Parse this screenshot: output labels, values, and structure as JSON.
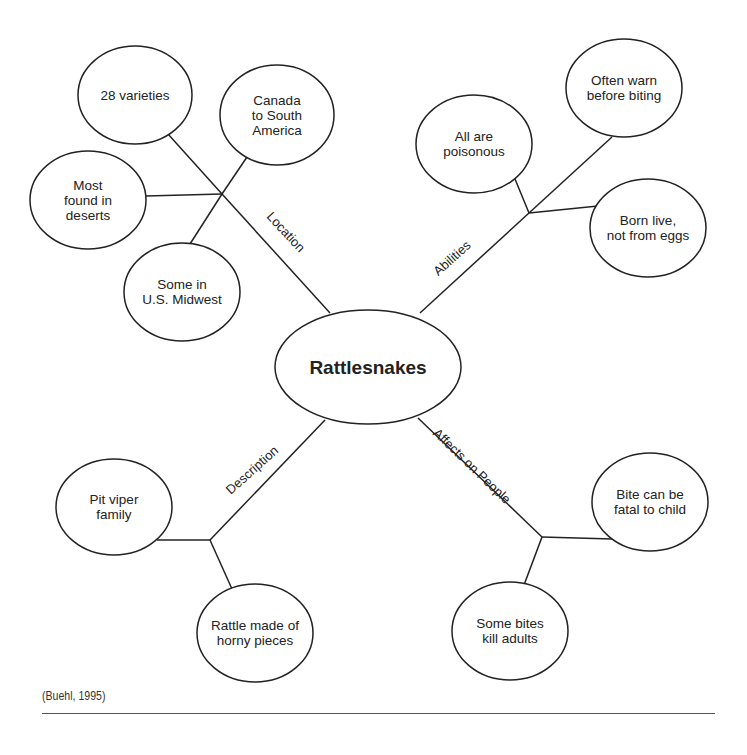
{
  "center": {
    "label": "Rattlesnakes",
    "cx": 368,
    "cy": 367,
    "rx": 93,
    "ry": 57
  },
  "branches": [
    {
      "label": "Location",
      "label_pos": [
        286,
        232
      ],
      "label_angle": 47,
      "line": [
        [
          330,
          313
        ],
        [
          222,
          194
        ]
      ],
      "junction": [
        222,
        194
      ],
      "nodes": [
        {
          "lines": [
            "28 varieties"
          ],
          "cx": 135,
          "cy": 95,
          "rx": 57,
          "ry": 49,
          "connect": [
            [
              168,
              134
            ],
            [
              222,
              194
            ]
          ]
        },
        {
          "lines": [
            "Canada",
            "to South",
            "America"
          ],
          "cx": 277,
          "cy": 115,
          "rx": 57,
          "ry": 50,
          "connect": [
            [
              247,
              157
            ],
            [
              222,
              194
            ]
          ]
        },
        {
          "lines": [
            "Most",
            "found in",
            "deserts"
          ],
          "cx": 88,
          "cy": 200,
          "rx": 58,
          "ry": 49,
          "connect": [
            [
              146,
              196
            ],
            [
              222,
              194
            ]
          ]
        },
        {
          "lines": [
            "Some in",
            "U.S. Midwest"
          ],
          "cx": 182,
          "cy": 292,
          "rx": 58,
          "ry": 49,
          "connect": [
            [
              190,
              244
            ],
            [
              222,
              194
            ]
          ]
        }
      ]
    },
    {
      "label": "Abilities",
      "label_pos": [
        452,
        258
      ],
      "label_angle": -42,
      "line": [
        [
          420,
          313
        ],
        [
          529,
          213
        ]
      ],
      "junction": [
        529,
        213
      ],
      "nodes": [
        {
          "lines": [
            "All are",
            "poisonous"
          ],
          "cx": 474,
          "cy": 144,
          "rx": 58,
          "ry": 49,
          "connect": [
            [
              515,
              179
            ],
            [
              529,
              213
            ]
          ]
        },
        {
          "lines": [
            "Often warn",
            "before biting"
          ],
          "cx": 624,
          "cy": 88,
          "rx": 58,
          "ry": 49,
          "connect": [
            [
              612,
              137
            ],
            [
              529,
              213
            ]
          ]
        },
        {
          "lines": [
            "Born live,",
            "not from eggs"
          ],
          "cx": 648,
          "cy": 228,
          "rx": 58,
          "ry": 49,
          "connect": [
            [
              598,
              206
            ],
            [
              529,
              213
            ]
          ]
        }
      ]
    },
    {
      "label": "Description",
      "label_pos": [
        252,
        470
      ],
      "label_angle": -42,
      "line": [
        [
          325,
          420
        ],
        [
          210,
          540
        ]
      ],
      "junction": [
        210,
        540
      ],
      "nodes": [
        {
          "lines": [
            "Pit viper",
            "family"
          ],
          "cx": 114,
          "cy": 507,
          "rx": 58,
          "ry": 48,
          "connect": [
            [
              157,
              540
            ],
            [
              210,
              540
            ]
          ]
        },
        {
          "lines": [
            "Rattle made of",
            "horny pieces"
          ],
          "cx": 255,
          "cy": 633,
          "rx": 58,
          "ry": 49,
          "connect": [
            [
              232,
              589
            ],
            [
              210,
              540
            ]
          ]
        }
      ]
    },
    {
      "label": "Affects on People",
      "label_pos": [
        472,
        466
      ],
      "label_angle": 44,
      "line": [
        [
          418,
          418
        ],
        [
          542,
          537
        ]
      ],
      "junction": [
        542,
        537
      ],
      "nodes": [
        {
          "lines": [
            "Bite can be",
            "fatal to child"
          ],
          "cx": 650,
          "cy": 502,
          "rx": 58,
          "ry": 49,
          "connect": [
            [
              612,
              539
            ],
            [
              542,
              537
            ]
          ]
        },
        {
          "lines": [
            "Some bites",
            "kill adults"
          ],
          "cx": 510,
          "cy": 631,
          "rx": 58,
          "ry": 49,
          "connect": [
            [
              524,
              585
            ],
            [
              542,
              537
            ]
          ]
        }
      ]
    }
  ],
  "footer": {
    "citation": "(Buehl, 1995)"
  },
  "colors": {
    "stroke": "#222222",
    "background": "#ffffff"
  }
}
